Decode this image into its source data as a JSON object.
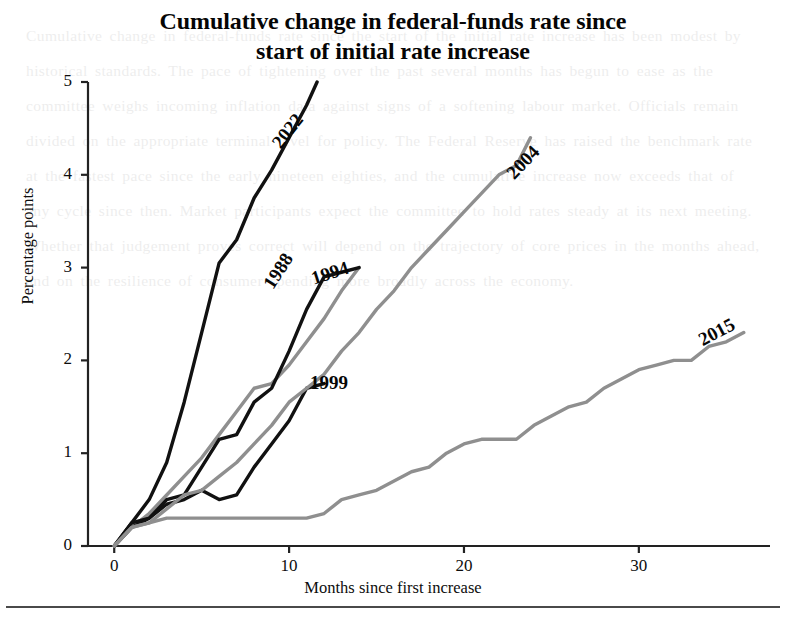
{
  "chart_data": {
    "type": "line",
    "title": "Cumulative change in federal-funds rate since start of initial rate increase",
    "title_line1": "Cumulative change in federal-funds rate since",
    "title_line2": "start of initial rate increase",
    "xlabel": "Months since first increase",
    "ylabel": "Percentage points",
    "xlim": [
      -1.5,
      37.5
    ],
    "ylim": [
      0,
      5
    ],
    "xticks": [
      0,
      10,
      20,
      30
    ],
    "xtick_labels": [
      "0",
      "10",
      "20",
      "30"
    ],
    "yticks": [
      0,
      1,
      2,
      3,
      4,
      5
    ],
    "ytick_labels": [
      "0",
      "1",
      "2",
      "3",
      "4",
      "5"
    ],
    "grid": false,
    "legend_position": "inline-series-labels",
    "colors": {
      "black": "#111111",
      "gray": "#8f8f8f",
      "axis": "#222222"
    },
    "series": [
      {
        "name": "2022",
        "color": "#111111",
        "label_rotation": -52,
        "label_x": 276,
        "label_y": 135,
        "points": [
          [
            0,
            0.0
          ],
          [
            1,
            0.25
          ],
          [
            2,
            0.5
          ],
          [
            3,
            0.9
          ],
          [
            4,
            1.55
          ],
          [
            5,
            2.3
          ],
          [
            6,
            3.05
          ],
          [
            7,
            3.3
          ],
          [
            8,
            3.75
          ],
          [
            9,
            4.05
          ],
          [
            10,
            4.4
          ],
          [
            11,
            4.75
          ],
          [
            11.6,
            5.0
          ]
        ]
      },
      {
        "name": "1988",
        "color": "#8f8f8f",
        "label_rotation": -57,
        "label_x": 268,
        "label_y": 276,
        "points": [
          [
            0,
            0.0
          ],
          [
            1,
            0.2
          ],
          [
            2,
            0.35
          ],
          [
            3,
            0.55
          ],
          [
            4,
            0.75
          ],
          [
            5,
            0.95
          ],
          [
            6,
            1.2
          ],
          [
            7,
            1.45
          ],
          [
            8,
            1.7
          ],
          [
            9,
            1.75
          ],
          [
            10,
            1.95
          ],
          [
            11,
            2.2
          ],
          [
            12,
            2.45
          ],
          [
            13,
            2.75
          ],
          [
            14,
            3.0
          ]
        ]
      },
      {
        "name": "1994",
        "color": "#111111",
        "label_rotation": -18,
        "label_x": 312,
        "label_y": 268,
        "points": [
          [
            0,
            0.0
          ],
          [
            1,
            0.25
          ],
          [
            2,
            0.3
          ],
          [
            3,
            0.5
          ],
          [
            4,
            0.55
          ],
          [
            5,
            0.85
          ],
          [
            6,
            1.15
          ],
          [
            7,
            1.2
          ],
          [
            8,
            1.55
          ],
          [
            9,
            1.7
          ],
          [
            10,
            2.1
          ],
          [
            11,
            2.55
          ],
          [
            12,
            2.9
          ],
          [
            13,
            2.95
          ],
          [
            14,
            3.0
          ]
        ]
      },
      {
        "name": "1999",
        "color": "#111111",
        "label_rotation": 0,
        "label_x": 310,
        "label_y": 372,
        "points": [
          [
            0,
            0.0
          ],
          [
            1,
            0.2
          ],
          [
            2,
            0.3
          ],
          [
            3,
            0.45
          ],
          [
            4,
            0.5
          ],
          [
            5,
            0.6
          ],
          [
            6,
            0.5
          ],
          [
            7,
            0.55
          ],
          [
            8,
            0.85
          ],
          [
            9,
            1.1
          ],
          [
            10,
            1.35
          ],
          [
            11,
            1.7
          ],
          [
            12,
            1.75
          ]
        ]
      },
      {
        "name": "2004",
        "color": "#8f8f8f",
        "label_rotation": -46,
        "label_x": 510,
        "label_y": 165,
        "points": [
          [
            0,
            0.0
          ],
          [
            1,
            0.2
          ],
          [
            2,
            0.25
          ],
          [
            3,
            0.4
          ],
          [
            4,
            0.55
          ],
          [
            5,
            0.6
          ],
          [
            6,
            0.75
          ],
          [
            7,
            0.9
          ],
          [
            8,
            1.1
          ],
          [
            9,
            1.3
          ],
          [
            10,
            1.55
          ],
          [
            11,
            1.7
          ],
          [
            12,
            1.85
          ],
          [
            13,
            2.1
          ],
          [
            14,
            2.3
          ],
          [
            15,
            2.55
          ],
          [
            16,
            2.75
          ],
          [
            17,
            3.0
          ],
          [
            18,
            3.2
          ],
          [
            19,
            3.4
          ],
          [
            20,
            3.6
          ],
          [
            21,
            3.8
          ],
          [
            22,
            4.0
          ],
          [
            23,
            4.1
          ],
          [
            23.8,
            4.4
          ]
        ]
      },
      {
        "name": "2015",
        "color": "#8f8f8f",
        "label_rotation": -28,
        "label_x": 700,
        "label_y": 330,
        "points": [
          [
            0,
            0.0
          ],
          [
            1,
            0.2
          ],
          [
            2,
            0.25
          ],
          [
            3,
            0.3
          ],
          [
            4,
            0.3
          ],
          [
            5,
            0.3
          ],
          [
            6,
            0.3
          ],
          [
            7,
            0.3
          ],
          [
            8,
            0.3
          ],
          [
            9,
            0.3
          ],
          [
            10,
            0.3
          ],
          [
            11,
            0.3
          ],
          [
            12,
            0.35
          ],
          [
            13,
            0.5
          ],
          [
            14,
            0.55
          ],
          [
            15,
            0.6
          ],
          [
            16,
            0.7
          ],
          [
            17,
            0.8
          ],
          [
            18,
            0.85
          ],
          [
            19,
            1.0
          ],
          [
            20,
            1.1
          ],
          [
            21,
            1.15
          ],
          [
            22,
            1.15
          ],
          [
            23,
            1.15
          ],
          [
            24,
            1.3
          ],
          [
            25,
            1.4
          ],
          [
            26,
            1.5
          ],
          [
            27,
            1.55
          ],
          [
            28,
            1.7
          ],
          [
            29,
            1.8
          ],
          [
            30,
            1.9
          ],
          [
            31,
            1.95
          ],
          [
            32,
            2.0
          ],
          [
            33,
            2.0
          ],
          [
            34,
            2.15
          ],
          [
            35,
            2.2
          ],
          [
            36,
            2.3
          ]
        ]
      }
    ]
  },
  "page": {
    "bleed_text": "Cumulative change in federal-funds rate since the start of the initial rate increase has been modest by historical standards. The pace of tightening over the past several months has begun to ease as the committee weighs incoming inflation data against signs of a softening labour market. Officials remain divided on the appropriate terminal level for policy. The Federal Reserve has raised the benchmark rate at the fastest pace since the early nineteen eighties, and the cumulative increase now exceeds that of any cycle since then. Market participants expect the committee to hold rates steady at its next meeting. Whether that judgement proves correct will depend on the trajectory of core prices in the months ahead, and on the resilience of consumer spending more broadly across the economy."
  }
}
